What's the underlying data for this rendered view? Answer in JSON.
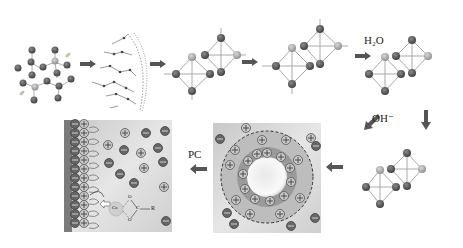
{
  "diagram": {
    "stages": [
      {
        "id": "precursor",
        "description": "ordered silicate/aluminate network"
      },
      {
        "id": "depolymerized",
        "description": "disordered network chain"
      },
      {
        "id": "charged_tetrahedra",
        "charge_signs": [
          "−",
          "+",
          "−",
          "+",
          "+"
        ],
        "atom_label": "O"
      },
      {
        "id": "cation_balanced",
        "labels": [
          "Ca",
          "K",
          "Na",
          "K",
          "O"
        ]
      },
      {
        "id": "hydrated",
        "reagent": "H₂O",
        "groups": [
          "O–H",
          "O–H",
          "H–O",
          "O–H",
          "OH"
        ]
      },
      {
        "id": "hydroxylated",
        "reagent": "OH⁻",
        "groups": [
          "O–H",
          "HO",
          "H–O",
          "O–H",
          "H–O",
          "O–H",
          "OH"
        ]
      },
      {
        "id": "particle_double_layer",
        "description": "particle with adsorbed cations and diffuse layer"
      },
      {
        "id": "pc_adsorption",
        "label": "PC",
        "cation": "Ca",
        "group": "R",
        "carboxyl_atoms": [
          "O",
          "C",
          "O"
        ]
      }
    ],
    "labels": {
      "h2o": "H₂O",
      "oh": "OH⁻",
      "pc": "PC",
      "ca": "Ca",
      "r": "R",
      "c": "C",
      "o": "O"
    },
    "colors": {
      "atom_dark": "#4a4a4a",
      "atom_light": "#a8a8a8",
      "bond": "#9a9a9a",
      "arrow": "#555555",
      "panel_bg": "#d8d8d8",
      "particle_core": "#f2f2f2",
      "dashed_ring": "#333333"
    }
  }
}
